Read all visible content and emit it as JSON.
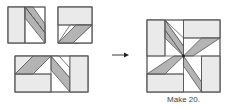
{
  "diagram": {
    "caption": "Make 20.",
    "colors": {
      "light": "#eaeaea",
      "white": "#ffffff",
      "dark": "#b4b4b4",
      "line": "#555555"
    },
    "units": [
      {
        "name": "unit-a",
        "description": "Square with left light rectangle and right half containing a diagonal gray parallelogram"
      },
      {
        "name": "unit-b",
        "description": "Square with top light rectangle and bottom half containing a diagonal gray parallelogram"
      },
      {
        "name": "unit-c",
        "description": "Rectangle combining parallelogram units and a light side rectangle"
      }
    ],
    "arrow": {
      "direction": "right"
    },
    "result": {
      "name": "eight-pointed-star-block",
      "description": "Finished block with eight gray parallelogram star points radiating from center"
    }
  }
}
